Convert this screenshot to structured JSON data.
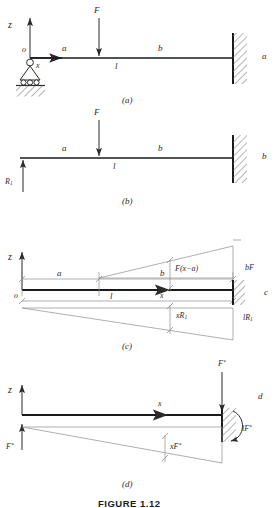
{
  "figure": {
    "caption": "FIGURE 1.12",
    "panels": [
      {
        "id": "a",
        "tag": "(a)",
        "side_letter": "a",
        "labels": {
          "axis_z": "z",
          "origin": "o",
          "axis_x": "x",
          "segment_a": "a",
          "segment_b": "b",
          "span_l": "l",
          "force": "F"
        }
      },
      {
        "id": "b",
        "tag": "(b)",
        "side_letter": "b",
        "labels": {
          "reaction": "R",
          "reaction_sub": "1",
          "segment_a": "a",
          "segment_b": "b",
          "span_l": "l",
          "force": "F"
        }
      },
      {
        "id": "c",
        "tag": "(c)",
        "side_letter": "c",
        "labels": {
          "axis_z": "z",
          "origin": "o",
          "axis_x": "x",
          "segment_a": "a",
          "segment_b": "b",
          "span_l": "l",
          "moment_upper": "F(x−a)",
          "moment_upper_end": "bF",
          "moment_lower": "xR",
          "moment_lower_sub": "1",
          "moment_lower_end": "lR",
          "moment_lower_end_sub": "1"
        }
      },
      {
        "id": "d",
        "tag": "(d)",
        "side_letter": "d",
        "labels": {
          "axis_z": "z",
          "axis_x": "x",
          "virtual_force_top": "F",
          "virtual_force_top_sup": "*",
          "virtual_moment": "lF",
          "virtual_moment_sup": "*",
          "virtual_force_left": "F",
          "virtual_force_left_sup": "*",
          "virtual_moment_mid": "xF",
          "virtual_moment_mid_sup": "*"
        }
      }
    ]
  },
  "style": {
    "ink": "#2b2b2b",
    "beam": "#1a1a1a",
    "thin": "#8d8d8d",
    "hatch": "#6e6e6e"
  }
}
